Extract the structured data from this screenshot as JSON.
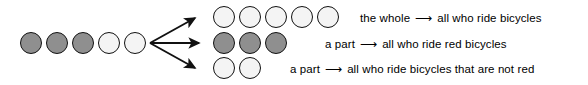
{
  "figure": {
    "type": "part-whole-set-diagram",
    "colors": {
      "stroke": "#111111",
      "dark_fill": "#8f8f8f",
      "light_fill": "#f4f4f4",
      "text": "#000000",
      "background": "#ffffff"
    },
    "whole_group": {
      "name": "whole-set-row",
      "total_count": 5,
      "dark_count": 3,
      "light_count": 2,
      "shades": [
        "dark",
        "dark",
        "dark",
        "light",
        "light"
      ]
    },
    "branches": [
      {
        "id": "whole",
        "group_name": "whole-row",
        "count": 5,
        "shades": [
          "light",
          "light",
          "light",
          "light",
          "light"
        ],
        "part_label": "the whole",
        "arrow_glyph": "⟶",
        "target_label": "all who ride bicycles"
      },
      {
        "id": "red-part",
        "group_name": "red-part-row",
        "count": 3,
        "shades": [
          "dark",
          "dark",
          "dark"
        ],
        "part_label": "a part",
        "arrow_glyph": "⟶",
        "target_label": "all who ride red bicycles"
      },
      {
        "id": "not-red-part",
        "group_name": "not-red-part-row",
        "count": 2,
        "shades": [
          "light",
          "light"
        ],
        "part_label": "a part",
        "arrow_glyph": "⟶",
        "target_label": "all who ride bicycles that are not red"
      }
    ]
  }
}
